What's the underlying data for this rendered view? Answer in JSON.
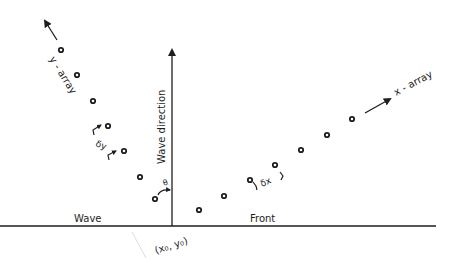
{
  "diagram": {
    "labels": {
      "y_array": "y - array",
      "x_array": "x - array",
      "wave_direction": "Wave direction",
      "wave": "Wave",
      "front": "Front",
      "origin": "(x₀, y₀)",
      "delta_y": "δy",
      "delta_x": "δx",
      "theta": "θ"
    },
    "colors": {
      "ink": "#1e1e1e",
      "background": "#ffffff"
    },
    "y_array_points": 7,
    "x_array_points": 7
  }
}
